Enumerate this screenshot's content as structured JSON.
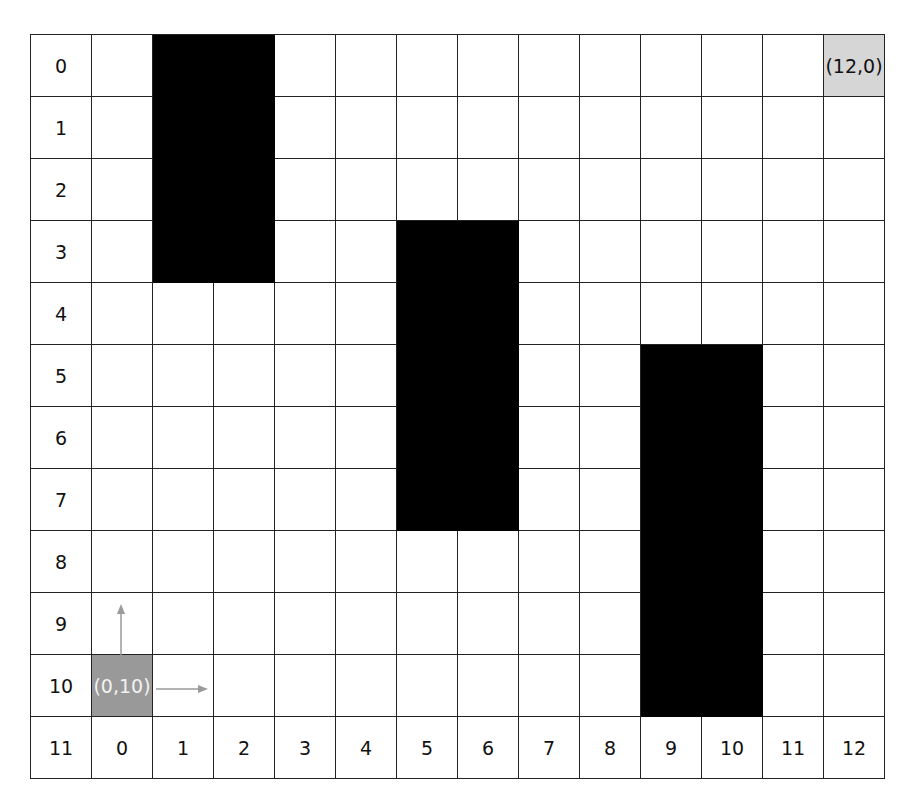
{
  "grid": {
    "columns": 13,
    "rows": 11,
    "row_labels": [
      "0",
      "1",
      "2",
      "3",
      "4",
      "5",
      "6",
      "7",
      "8",
      "9",
      "10"
    ],
    "bottom_corner_label": "11",
    "column_labels": [
      "0",
      "1",
      "2",
      "3",
      "4",
      "5",
      "6",
      "7",
      "8",
      "9",
      "10",
      "11",
      "12"
    ],
    "obstacles": [
      {
        "col_start": 1,
        "col_end": 2,
        "row_start": 0,
        "row_end": 3
      },
      {
        "col_start": 5,
        "col_end": 6,
        "row_start": 3,
        "row_end": 7
      },
      {
        "col_start": 9,
        "col_end": 10,
        "row_start": 5,
        "row_end": 10
      }
    ],
    "start": {
      "col": 0,
      "row": 10,
      "label": "(0,10)",
      "color": "#999999"
    },
    "goal": {
      "col": 12,
      "row": 0,
      "label": "(12,0)",
      "color": "#d6d6d6"
    },
    "axis_arrows": {
      "up": "y-axis-arrow",
      "right": "x-axis-arrow",
      "color": "#9a9a9a"
    }
  }
}
